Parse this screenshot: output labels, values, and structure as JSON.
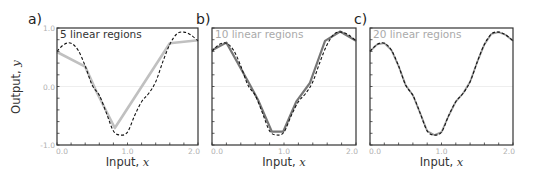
{
  "figure": {
    "panels": [
      {
        "letter": "a)",
        "annotation": "5 linear regions",
        "annotation_color": "#333333"
      },
      {
        "letter": "b)",
        "annotation": "10 linear regions",
        "annotation_color": "#aaaaaa"
      },
      {
        "letter": "c)",
        "annotation": "20 linear regions",
        "annotation_color": "#aaaaaa"
      }
    ],
    "ylabel_text": "Output, ",
    "ylabel_var": "y",
    "xlabel_text": "Input, ",
    "xlabel_var": "x",
    "xticks": [
      "0.0",
      "1.0",
      "2.0"
    ],
    "yticks": [
      "1.0",
      "0.0",
      "-1.0"
    ],
    "colors": {
      "true_function": "#111111",
      "approx_a": "#c0c0c0",
      "approx_b": "#777777",
      "approx_c": "#999999",
      "frame": "#333333",
      "zero_line": "#eeeeee"
    }
  },
  "chart_data": [
    {
      "type": "line",
      "title": "a) 5 linear regions",
      "xlabel": "Input, x",
      "ylabel": "Output, y",
      "xlim": [
        0,
        2
      ],
      "ylim": [
        -1,
        1
      ],
      "grid": false,
      "series": [
        {
          "name": "true function (dashed)",
          "x": [
            0,
            0.1,
            0.2,
            0.3,
            0.4,
            0.5,
            0.6,
            0.7,
            0.8,
            0.9,
            1.0,
            1.1,
            1.2,
            1.3,
            1.4,
            1.5,
            1.6,
            1.7,
            1.8,
            1.9,
            2.0
          ],
          "y": [
            0.6,
            0.72,
            0.74,
            0.62,
            0.35,
            0.02,
            -0.15,
            -0.45,
            -0.76,
            -0.83,
            -0.78,
            -0.5,
            -0.26,
            -0.12,
            0.08,
            0.42,
            0.72,
            0.9,
            0.93,
            0.88,
            0.78
          ]
        },
        {
          "name": "5-region piecewise linear (gray)",
          "x": [
            0,
            0.4,
            0.56,
            0.82,
            1.6,
            2.0
          ],
          "y": [
            0.59,
            0.34,
            -0.09,
            -0.71,
            0.74,
            0.79
          ]
        }
      ]
    },
    {
      "type": "line",
      "title": "b) 10 linear regions",
      "xlabel": "Input, x",
      "ylabel": "",
      "xlim": [
        0,
        2
      ],
      "ylim": [
        -1,
        1
      ],
      "grid": false,
      "series": [
        {
          "name": "true function (dashed)",
          "x": [
            0,
            0.1,
            0.2,
            0.3,
            0.4,
            0.5,
            0.6,
            0.7,
            0.8,
            0.9,
            1.0,
            1.1,
            1.2,
            1.3,
            1.4,
            1.5,
            1.6,
            1.7,
            1.8,
            1.9,
            2.0
          ],
          "y": [
            0.6,
            0.72,
            0.74,
            0.62,
            0.35,
            0.02,
            -0.15,
            -0.45,
            -0.76,
            -0.83,
            -0.78,
            -0.5,
            -0.26,
            -0.12,
            0.08,
            0.42,
            0.72,
            0.9,
            0.93,
            0.88,
            0.78
          ]
        },
        {
          "name": "10-region piecewise linear",
          "x": [
            0,
            0.2,
            0.53,
            0.64,
            0.83,
            0.99,
            1.17,
            1.36,
            1.57,
            1.78,
            2.0
          ],
          "y": [
            0.62,
            0.75,
            0.02,
            -0.23,
            -0.77,
            -0.77,
            -0.26,
            0.06,
            0.78,
            0.94,
            0.78
          ]
        }
      ]
    },
    {
      "type": "line",
      "title": "c) 20 linear regions",
      "xlabel": "Input, x",
      "ylabel": "",
      "xlim": [
        0,
        2
      ],
      "ylim": [
        -1,
        1
      ],
      "grid": false,
      "series": [
        {
          "name": "true function (dashed)",
          "x": [
            0,
            0.1,
            0.2,
            0.3,
            0.4,
            0.5,
            0.6,
            0.7,
            0.8,
            0.9,
            1.0,
            1.1,
            1.2,
            1.3,
            1.4,
            1.5,
            1.6,
            1.7,
            1.8,
            1.9,
            2.0
          ],
          "y": [
            0.6,
            0.72,
            0.74,
            0.62,
            0.35,
            0.02,
            -0.15,
            -0.45,
            -0.76,
            -0.83,
            -0.78,
            -0.5,
            -0.26,
            -0.12,
            0.08,
            0.42,
            0.72,
            0.9,
            0.93,
            0.88,
            0.78
          ]
        },
        {
          "name": "20-region piecewise linear",
          "x": [
            0,
            0.1,
            0.2,
            0.3,
            0.4,
            0.5,
            0.6,
            0.7,
            0.8,
            0.9,
            1.0,
            1.1,
            1.2,
            1.3,
            1.4,
            1.5,
            1.6,
            1.7,
            1.8,
            1.9,
            2.0
          ],
          "y": [
            0.6,
            0.72,
            0.74,
            0.62,
            0.35,
            0.02,
            -0.15,
            -0.45,
            -0.76,
            -0.83,
            -0.78,
            -0.5,
            -0.26,
            -0.12,
            0.08,
            0.42,
            0.72,
            0.9,
            0.93,
            0.88,
            0.78
          ]
        }
      ]
    }
  ]
}
